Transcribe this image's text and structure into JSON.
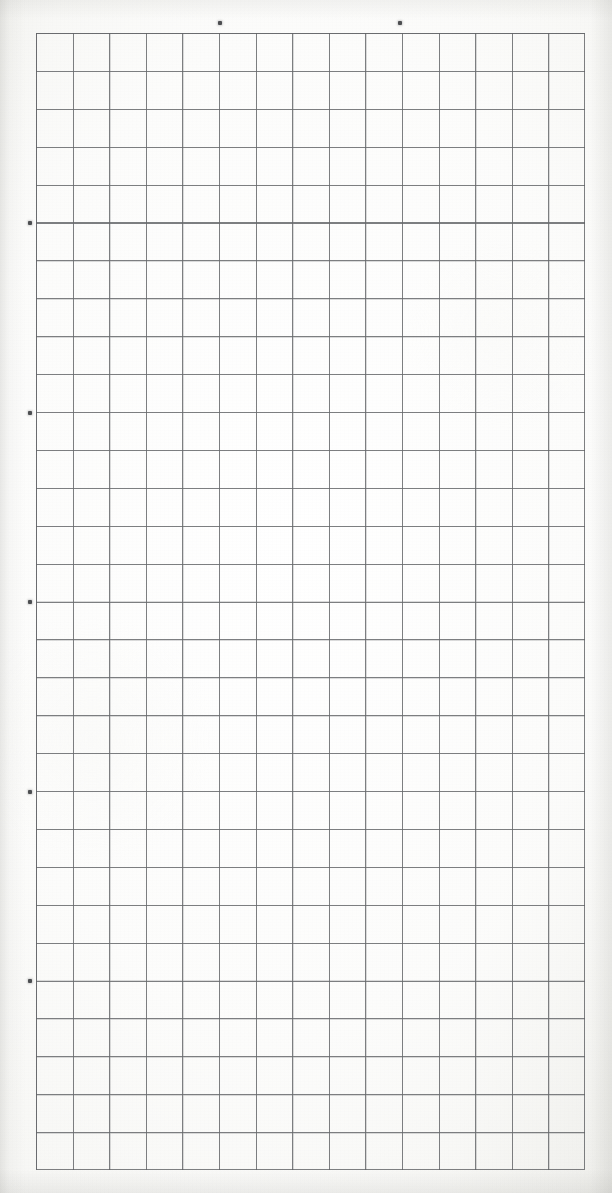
{
  "document": {
    "kind": "scanned-grid-paper",
    "width_px": 612,
    "height_px": 1193,
    "background_color": "#fbfbf9",
    "paper_tint": "#f4f4f1"
  },
  "grid": {
    "columns": 15,
    "rows": 30,
    "left_px": 36,
    "top_px": 33,
    "width_px": 549,
    "height_px": 1137,
    "cell_width_px": 36.6,
    "cell_height_px": 37.9,
    "line_color": "#5f6164",
    "line_width_px": 1,
    "border_color": "#5f6164"
  },
  "marks": {
    "color": "#4c4e51",
    "size_px": 4,
    "top": [
      {
        "label": "top-mark-1",
        "x": 218,
        "y": 21
      },
      {
        "label": "top-mark-2",
        "x": 398,
        "y": 21
      }
    ],
    "left": [
      {
        "label": "left-mark-1",
        "x": 28,
        "y": 221
      },
      {
        "label": "left-mark-2",
        "x": 28,
        "y": 411
      },
      {
        "label": "left-mark-3",
        "x": 28,
        "y": 600
      },
      {
        "label": "left-mark-4",
        "x": 28,
        "y": 790
      },
      {
        "label": "left-mark-5",
        "x": 28,
        "y": 979
      }
    ]
  }
}
